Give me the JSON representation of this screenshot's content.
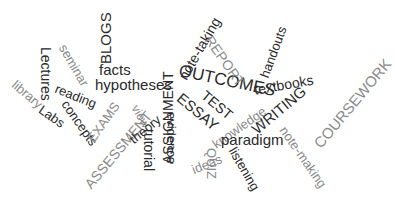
{
  "word_cloud": {
    "colors": {
      "dark": "#2a2a2a",
      "light": "#8a8a8a",
      "background": "#ffffff"
    },
    "words": [
      {
        "text": "BLOGS",
        "x": 98,
        "y": 64,
        "size": 15,
        "rot": -90,
        "tone": "dark"
      },
      {
        "text": "facts",
        "x": 99,
        "y": 62,
        "size": 15,
        "rot": 0,
        "tone": "dark"
      },
      {
        "text": "hypotheses",
        "x": 95,
        "y": 77,
        "size": 15,
        "rot": 0,
        "tone": "dark"
      },
      {
        "text": "seminar",
        "x": 68,
        "y": 42,
        "size": 13,
        "rot": 60,
        "tone": "light"
      },
      {
        "text": "Lectures",
        "x": 53,
        "y": 47,
        "size": 14,
        "rot": 90,
        "tone": "dark"
      },
      {
        "text": "library",
        "x": 18,
        "y": 78,
        "size": 13,
        "rot": 40,
        "tone": "light"
      },
      {
        "text": "reading",
        "x": 58,
        "y": 82,
        "size": 13,
        "rot": 22,
        "tone": "dark"
      },
      {
        "text": "Labs",
        "x": 44,
        "y": 103,
        "size": 13,
        "rot": 35,
        "tone": "dark"
      },
      {
        "text": "concepts",
        "x": 70,
        "y": 98,
        "size": 13,
        "rot": 55,
        "tone": "dark"
      },
      {
        "text": "EXAMS",
        "x": 85,
        "y": 137,
        "size": 13,
        "rot": -55,
        "tone": "light"
      },
      {
        "text": "ASSESSMENT",
        "x": 82,
        "y": 182,
        "size": 14,
        "rot": -50,
        "tone": "light"
      },
      {
        "text": "view",
        "x": 140,
        "y": 103,
        "size": 12,
        "rot": 60,
        "tone": "light"
      },
      {
        "text": "theory",
        "x": 127,
        "y": 136,
        "size": 13,
        "rot": -40,
        "tone": "dark"
      },
      {
        "text": "tutorial",
        "x": 156,
        "y": 129,
        "size": 14,
        "rot": 90,
        "tone": "dark"
      },
      {
        "text": "ASSIGNMENT",
        "x": 161,
        "y": 164,
        "size": 14,
        "rot": -90,
        "tone": "dark"
      },
      {
        "text": "note-taking",
        "x": 176,
        "y": 75,
        "size": 14,
        "rot": -60,
        "tone": "dark"
      },
      {
        "text": "OUTCOMES",
        "x": 181,
        "y": 62,
        "size": 17,
        "rot": 12,
        "tone": "dark"
      },
      {
        "text": "REPORT",
        "x": 214,
        "y": 33,
        "size": 14,
        "rot": 55,
        "tone": "light"
      },
      {
        "text": "handouts",
        "x": 258,
        "y": 75,
        "size": 13,
        "rot": -70,
        "tone": "dark"
      },
      {
        "text": "textbooks",
        "x": 253,
        "y": 83,
        "size": 14,
        "rot": -10,
        "tone": "dark"
      },
      {
        "text": "ESSAY",
        "x": 184,
        "y": 90,
        "size": 15,
        "rot": 40,
        "tone": "dark"
      },
      {
        "text": "evidence",
        "x": 178,
        "y": 112,
        "size": 13,
        "rot": 90,
        "tone": "dark"
      },
      {
        "text": "TEST",
        "x": 208,
        "y": 88,
        "size": 14,
        "rot": 40,
        "tone": "dark"
      },
      {
        "text": "knowledge",
        "x": 210,
        "y": 140,
        "size": 13,
        "rot": -35,
        "tone": "light"
      },
      {
        "text": "WRITING",
        "x": 249,
        "y": 125,
        "size": 15,
        "rot": -40,
        "tone": "dark"
      },
      {
        "text": "ideas",
        "x": 190,
        "y": 164,
        "size": 13,
        "rot": -22,
        "tone": "light"
      },
      {
        "text": "paradigm",
        "x": 221,
        "y": 132,
        "size": 15,
        "rot": 0,
        "tone": "dark"
      },
      {
        "text": "QUIZ",
        "x": 218,
        "y": 148,
        "size": 13,
        "rot": 90,
        "tone": "light"
      },
      {
        "text": "listening",
        "x": 238,
        "y": 145,
        "size": 13,
        "rot": 60,
        "tone": "dark"
      },
      {
        "text": "note-making",
        "x": 288,
        "y": 124,
        "size": 13,
        "rot": 55,
        "tone": "light"
      },
      {
        "text": "COURSEWORK",
        "x": 311,
        "y": 141,
        "size": 15,
        "rot": -50,
        "tone": "light"
      }
    ]
  }
}
